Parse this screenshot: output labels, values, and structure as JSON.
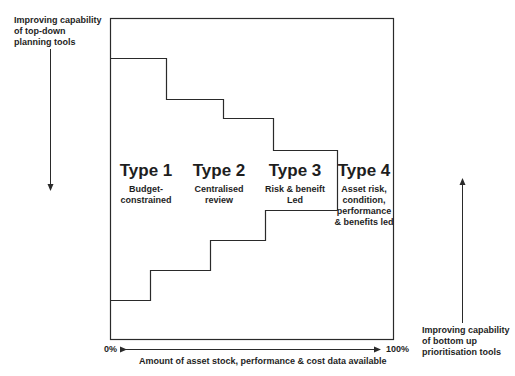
{
  "diagram": {
    "top_left_label": [
      "Improving capability",
      "of top-down",
      "planning tools"
    ],
    "bottom_right_label": [
      "Improving capability",
      "of bottom up",
      "prioritisation tools"
    ],
    "x_axis": {
      "start": "0%",
      "end": "100%",
      "label": "Amount of asset stock, performance & cost data available"
    },
    "types": [
      {
        "title": "Type 1",
        "description": [
          "Budget-",
          "constrained"
        ]
      },
      {
        "title": "Type 2",
        "description": [
          "Centralised",
          "review"
        ]
      },
      {
        "title": "Type 3",
        "description": [
          "Risk & beneift",
          "Led"
        ]
      },
      {
        "title": "Type 4",
        "description": [
          "Asset risk,",
          "condition,",
          "performance",
          "& benefits led"
        ]
      }
    ],
    "colors": {
      "line": "#2a2a2a",
      "text": "#1e1e1e",
      "background": "#ffffff"
    }
  }
}
